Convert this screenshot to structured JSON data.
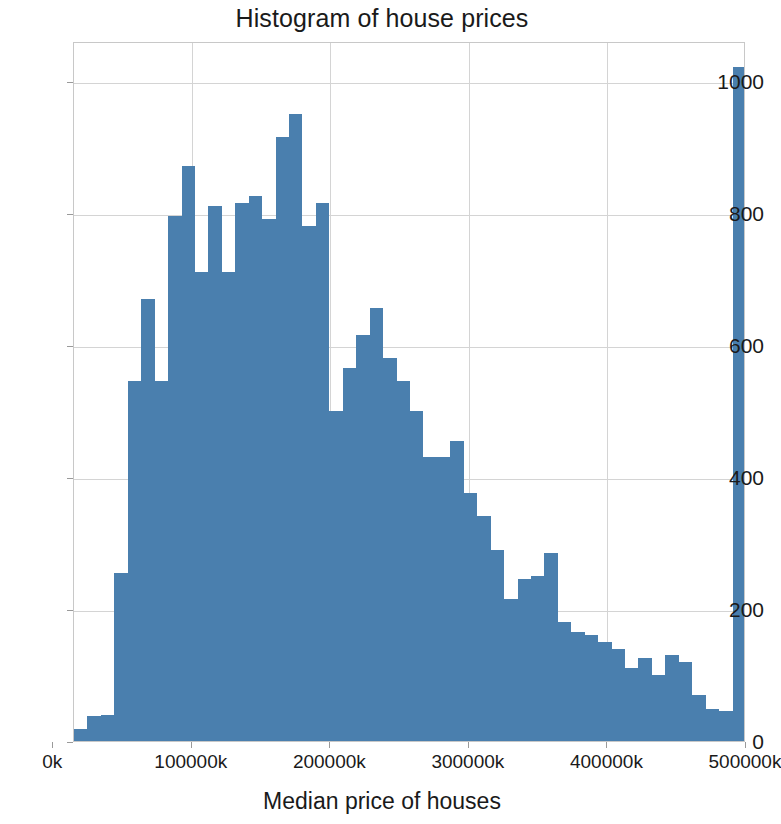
{
  "chart": {
    "title": "Histogram of house prices",
    "xlabel": "Median price of houses",
    "ylabel": ""
  },
  "chart_data": {
    "type": "bar",
    "title": "Histogram of house prices",
    "xlabel": "Median price of houses",
    "ylabel": "",
    "grid": true,
    "legend": null,
    "bar_color": "#4a7fae",
    "xlim": [
      14999,
      500001
    ],
    "ylim": [
      0,
      1060
    ],
    "xticks": [
      0,
      100000,
      200000,
      300000,
      400000,
      500000
    ],
    "xtick_labels": [
      "0k",
      "100000k",
      "200000k",
      "300000k",
      "400000k",
      "500000k"
    ],
    "yticks": [
      0,
      200,
      400,
      600,
      800,
      1000
    ],
    "ytick_labels": [
      "0",
      "200",
      "400",
      "600",
      "800",
      "1000"
    ],
    "bin_width": 9700,
    "bin_left_edges": [
      14999,
      24699,
      34399,
      44099,
      53799,
      63499,
      73199,
      82899,
      92599,
      102299,
      111999,
      121699,
      131399,
      141099,
      150799,
      160499,
      170199,
      179899,
      189599,
      199299,
      208999,
      218699,
      228399,
      238099,
      247799,
      257499,
      267199,
      276899,
      286599,
      296299,
      305999,
      315699,
      325399,
      335099,
      344799,
      354499,
      364199,
      373899,
      383599,
      393299,
      402999,
      412699,
      422399,
      432099,
      441799,
      451499,
      461199,
      470899,
      480599,
      490299
    ],
    "categories": [
      "15k-25k",
      "25k-34k",
      "34k-44k",
      "44k-54k",
      "54k-63k",
      "63k-73k",
      "73k-83k",
      "83k-93k",
      "93k-102k",
      "102k-112k",
      "112k-121k",
      "121k-131k",
      "131k-141k",
      "141k-151k",
      "151k-160k",
      "160k-170k",
      "170k-180k",
      "180k-190k",
      "190k-199k",
      "199k-209k",
      "209k-219k",
      "219k-228k",
      "228k-238k",
      "238k-248k",
      "248k-257k",
      "257k-267k",
      "267k-277k",
      "277k-287k",
      "287k-296k",
      "296k-306k",
      "306k-316k",
      "316k-325k",
      "325k-335k",
      "335k-345k",
      "345k-354k",
      "354k-364k",
      "364k-374k",
      "374k-384k",
      "384k-393k",
      "393k-403k",
      "403k-413k",
      "413k-422k",
      "422k-432k",
      "432k-442k",
      "442k-451k",
      "451k-461k",
      "461k-471k",
      "471k-481k",
      "481k-490k",
      "490k-500k"
    ],
    "values": [
      18,
      38,
      40,
      255,
      545,
      670,
      545,
      795,
      870,
      710,
      810,
      710,
      815,
      825,
      790,
      915,
      950,
      780,
      815,
      500,
      565,
      615,
      655,
      580,
      545,
      500,
      430,
      430,
      455,
      375,
      340,
      290,
      215,
      245,
      250,
      285,
      180,
      165,
      160,
      150,
      140,
      110,
      125,
      100,
      130,
      120,
      70,
      48,
      45,
      1020
    ]
  }
}
